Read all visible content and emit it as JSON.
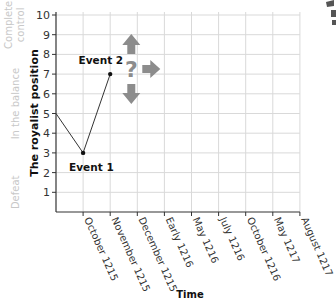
{
  "chart_data": {
    "type": "line",
    "title": "",
    "xlabel": "Time",
    "ylabel": "The royalist position",
    "ylim": [
      0,
      10
    ],
    "yticks": [
      1,
      2,
      3,
      4,
      5,
      6,
      7,
      8,
      9,
      10
    ],
    "categories": [
      "October 1215",
      "November 1215",
      "December 1215",
      "Early 1216",
      "May 1216",
      "July 1216",
      "October 1216",
      "May 1217",
      "August 1217"
    ],
    "grid": true,
    "series": [
      {
        "name": "Royalist position",
        "points": [
          {
            "x": "start",
            "y": 5
          },
          {
            "x": "October 1215",
            "y": 3
          },
          {
            "x": "November 1215",
            "y": 7
          }
        ]
      }
    ],
    "annotations": [
      {
        "label": "Event 1",
        "x": "October 1215",
        "y": 3
      },
      {
        "label": "Event 2",
        "x": "November 1215",
        "y": 7
      }
    ],
    "uncertainty_marker": {
      "symbol": "?",
      "x": "December 1215",
      "y": 7,
      "arrows": [
        "up",
        "right",
        "down"
      ]
    },
    "bands": [
      {
        "label": "Complete control",
        "range": [
          8.5,
          10.5
        ]
      },
      {
        "label": "In the balance",
        "range": [
          3,
          8
        ]
      },
      {
        "label": "Defeat",
        "range": [
          0,
          2
        ]
      }
    ]
  }
}
